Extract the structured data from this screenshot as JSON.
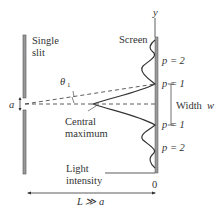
{
  "labels": {
    "single": "Single",
    "slit": "slit",
    "screen": "Screen",
    "y_axis": "y",
    "theta": "θ",
    "theta_sub": "1",
    "a": "a",
    "central": "Central",
    "maximum": "maximum",
    "p2_top": "p = 2",
    "p1_top": "p = 1",
    "width": "Width",
    "width_var": "w",
    "p1_bot": "p = 1",
    "p2_bot": "p = 2",
    "light": "Light",
    "intensity": "intensity",
    "zero": "0",
    "L": "L ≫ a"
  },
  "colors": {
    "line": "#333333",
    "screen_fill": "#999999",
    "slit_fill": "#999999"
  }
}
